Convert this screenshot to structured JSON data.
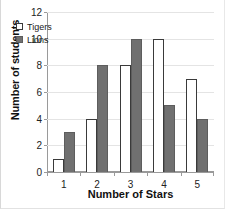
{
  "chart_data": {
    "type": "bar",
    "title": "",
    "categories": [
      "1",
      "2",
      "3",
      "4",
      "5"
    ],
    "series": [
      {
        "name": "Tigers",
        "values": [
          1,
          4,
          8,
          10,
          7
        ],
        "fill": "#ffffff",
        "stroke": "#3a3a3a"
      },
      {
        "name": "Lions",
        "values": [
          3,
          8,
          10,
          5,
          4
        ],
        "fill": "#707070",
        "stroke": "#5d5d5d"
      }
    ],
    "xlabel": "Number of Stars",
    "ylabel": "Number of students",
    "ylim": [
      0,
      12
    ],
    "yticks": [
      0,
      2,
      4,
      6,
      8,
      10,
      12
    ],
    "ytick_labels": [
      "0",
      "2",
      "4",
      "6",
      "8",
      "10",
      "12"
    ],
    "grid": true,
    "legend_position": "top-left"
  },
  "axes": {
    "y_title": "Number of students",
    "x_title": "Number of Stars"
  },
  "legend": {
    "entries": [
      {
        "label": "Tigers",
        "marker": "hollow-square"
      },
      {
        "label": "Lions",
        "marker": "filled-square"
      }
    ]
  }
}
